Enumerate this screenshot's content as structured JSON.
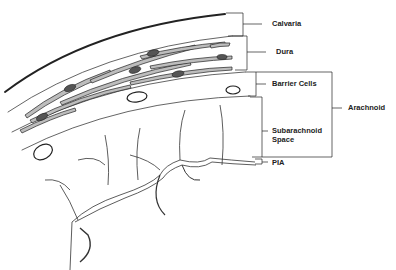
{
  "diagram": {
    "labels": {
      "calvaria": "Calvaria",
      "dura": "Dura",
      "barrier_cells": "Barrier Cells",
      "arachnoid": "Arachnoid",
      "subarachnoid_line1": "Subarachnoid",
      "subarachnoid_line2": "Space",
      "pia": "PIA"
    },
    "colors": {
      "ink": "#222222",
      "background": "#ffffff",
      "cell_fill": "#bdbdbd"
    }
  }
}
